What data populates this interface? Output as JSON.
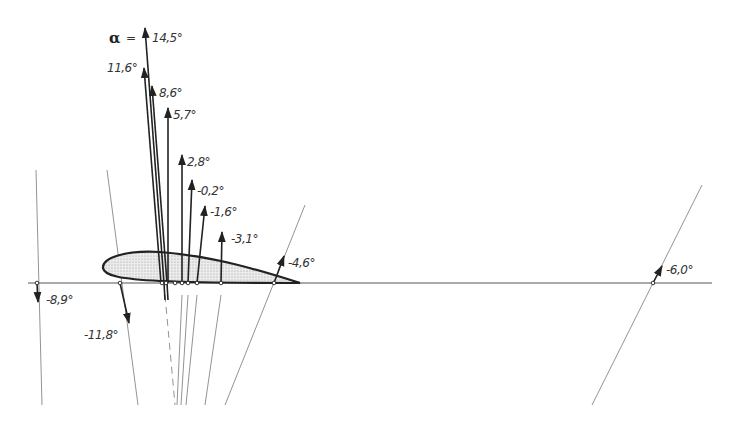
{
  "diagram": {
    "alpha_symbol": "α",
    "alpha_equals": "=",
    "colors": {
      "ink": "#222222",
      "thin": "#666666",
      "airfoil_fill": "#e2e2e2",
      "background": "#ffffff"
    },
    "labels": {
      "a14_5": "14,5°",
      "a11_6": "11,6°",
      "a8_6": "8,6°",
      "a5_7": "5,7°",
      "a2_8": "2,8°",
      "am0_2": "-0,2°",
      "am1_6": "-1,6°",
      "am3_1": "-3,1°",
      "am4_6": "-4,6°",
      "am6_0": "-6,0°",
      "am8_9": "-8,9°",
      "am11_8": "-11,8°"
    },
    "vectors": [
      {
        "alpha": "14,5°",
        "base_x": 164,
        "tip": [
          145,
          28
        ]
      },
      {
        "alpha": "11,6°",
        "base_x": 162,
        "tip": [
          144,
          68
        ]
      },
      {
        "alpha": "8,6°",
        "base_x": 167,
        "tip": [
          152,
          86
        ]
      },
      {
        "alpha": "5,7°",
        "base_x": 167,
        "tip": [
          168,
          108
        ]
      },
      {
        "alpha": "2,8°",
        "base_x": 182,
        "tip": [
          182,
          156
        ]
      },
      {
        "alpha": "-0,2°",
        "base_x": 188,
        "tip": [
          192,
          180
        ]
      },
      {
        "alpha": "-1,6°",
        "base_x": 197,
        "tip": [
          205,
          206
        ]
      },
      {
        "alpha": "-3,1°",
        "base_x": 221,
        "tip": [
          222,
          232
        ]
      },
      {
        "alpha": "-4,6°",
        "base_x": 274,
        "tip": [
          284,
          255
        ]
      },
      {
        "alpha": "-6,0°",
        "base_x": 653,
        "tip": [
          661,
          266
        ]
      },
      {
        "alpha": "-8,9°",
        "base_x": 37,
        "tip": [
          39,
          300
        ]
      },
      {
        "alpha": "-11,8°",
        "base_x": 120,
        "tip": [
          128,
          322
        ]
      }
    ]
  }
}
